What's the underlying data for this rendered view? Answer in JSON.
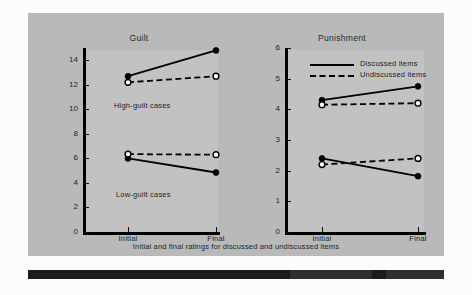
{
  "figure": {
    "caption": "Initial and final ratings for discussed and undiscussed items",
    "background_color": "#b9b9b9",
    "plot_color": "#c2c2c2",
    "ink_color": "#000000"
  },
  "legend": {
    "position": "top-left-of-right-panel",
    "entries": [
      {
        "label": "Discussed items",
        "style": "solid",
        "marker": "filled-circle"
      },
      {
        "label": "Undiscussed items",
        "style": "dashed",
        "marker": "open-circle"
      }
    ]
  },
  "annotations": {
    "high_guilt": "High-guilt cases",
    "low_guilt": "Low-guilt cases"
  },
  "chart_data": [
    {
      "type": "line",
      "title": "Guilt",
      "xlabel": "",
      "ylabel": "",
      "x": [
        "Initial",
        "Final"
      ],
      "xtick_labels": [
        "Initial",
        "Final"
      ],
      "ylim": [
        0,
        15
      ],
      "ytick_labels": [
        "0",
        "2",
        "4",
        "6",
        "8",
        "10",
        "12",
        "14"
      ],
      "yticks": [
        0,
        2,
        4,
        6,
        8,
        10,
        12,
        14
      ],
      "grid": false,
      "series": [
        {
          "name": "High-guilt cases / Discussed items",
          "style": "solid",
          "marker": "filled-circle",
          "values": [
            12.7,
            14.8
          ]
        },
        {
          "name": "High-guilt cases / Undiscussed items",
          "style": "dashed",
          "marker": "open-circle",
          "values": [
            12.2,
            12.7
          ]
        },
        {
          "name": "Low-guilt cases / Discussed items",
          "style": "solid",
          "marker": "filled-circle",
          "values": [
            6.0,
            4.85
          ]
        },
        {
          "name": "Low-guilt cases / Undiscussed items",
          "style": "dashed",
          "marker": "open-circle",
          "values": [
            6.35,
            6.3
          ]
        }
      ],
      "annotations": [
        {
          "text": "High-guilt cases",
          "near_y": 11.5
        },
        {
          "text": "Low-guilt cases",
          "near_y": 4.3
        }
      ]
    },
    {
      "type": "line",
      "title": "Punishment",
      "xlabel": "",
      "ylabel": "",
      "x": [
        "Initial",
        "Final"
      ],
      "xtick_labels": [
        "Initial",
        "Final"
      ],
      "ylim": [
        0,
        6
      ],
      "ytick_labels": [
        "0",
        "1",
        "2",
        "3",
        "4",
        "5",
        "6"
      ],
      "yticks": [
        0,
        1,
        2,
        3,
        4,
        5,
        6
      ],
      "grid": false,
      "series": [
        {
          "name": "High-guilt cases / Discussed items",
          "style": "solid",
          "marker": "filled-circle",
          "values": [
            4.3,
            4.75
          ]
        },
        {
          "name": "High-guilt cases / Undiscussed items",
          "style": "dashed",
          "marker": "open-circle",
          "values": [
            4.15,
            4.2
          ]
        },
        {
          "name": "Low-guilt cases / Discussed items",
          "style": "solid",
          "marker": "filled-circle",
          "values": [
            2.4,
            1.82
          ]
        },
        {
          "name": "Low-guilt cases / Undiscussed items",
          "style": "dashed",
          "marker": "open-circle",
          "values": [
            2.2,
            2.4
          ]
        }
      ],
      "annotations": []
    }
  ]
}
